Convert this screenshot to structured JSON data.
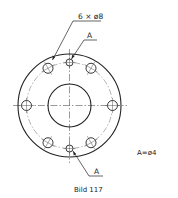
{
  "figure": {
    "caption": "Bild 117",
    "labels": {
      "hole_pattern_callout": "6 × ø8",
      "marked_hole_top": "A",
      "marked_hole_bottom": "A",
      "legend": "A=ø4"
    },
    "flange": {
      "pattern_hole_count": 6,
      "pattern_hole_diameter": "ø8",
      "marked_hole_count": 2,
      "marked_hole_diameter": "ø4",
      "pattern_hole_angles_deg": [
        0,
        60,
        120,
        180,
        240,
        300
      ],
      "marked_hole_angles_deg": [
        90,
        270
      ]
    },
    "colors": {
      "line": "#222222",
      "centerline": "#555555",
      "background": "#ffffff"
    }
  }
}
